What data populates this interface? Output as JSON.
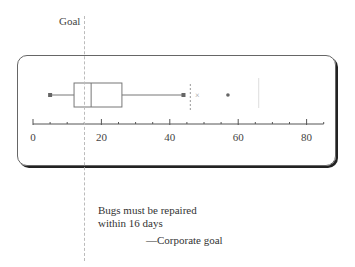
{
  "goal_label": "Goal",
  "note": {
    "line1": "Bugs must be repaired",
    "line2": "within 16 days",
    "attribution": "—Corporate goal"
  },
  "chart_data": {
    "type": "boxplot",
    "title": "",
    "xlabel": "",
    "ylabel": "",
    "orientation": "horizontal",
    "x_ticks": [
      0,
      20,
      40,
      60,
      80
    ],
    "x_minor_tick_step": 5,
    "xlim": [
      0,
      85
    ],
    "box": {
      "whisker_low": 5,
      "q1": 12,
      "median": 17,
      "q3": 26,
      "whisker_high": 44
    },
    "outliers": [
      {
        "value": 48,
        "marker": "x"
      },
      {
        "value": 57,
        "marker": "dot"
      }
    ],
    "reference_lines": [
      {
        "value": 16,
        "label": "Goal",
        "style": "dashed"
      },
      {
        "value": 46,
        "style": "dashed-short"
      },
      {
        "value": 66,
        "style": "faint"
      }
    ],
    "annotation": "Bugs must be repaired within 16 days —Corporate goal",
    "grid": false,
    "legend": null
  },
  "colors": {
    "box_stroke": "#777777",
    "points": "#666666",
    "axis": "#555555",
    "goal_line": "#bbbbbb",
    "panel_shadow": "#222222"
  }
}
